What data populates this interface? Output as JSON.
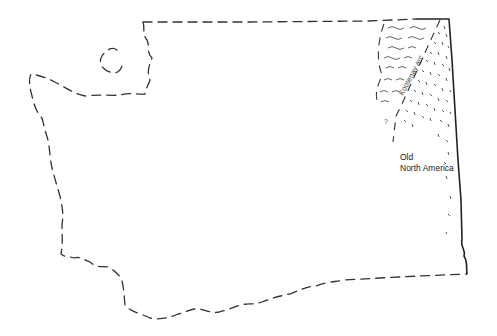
{
  "map": {
    "region": "Washington State outline",
    "labels": {
      "arc": "Kootenay arc",
      "craton_line1": "Old",
      "craton_line2": "North America",
      "uncertain_mark": "?"
    },
    "colors": {
      "background": "#ffffff",
      "ink": "#333333"
    }
  }
}
